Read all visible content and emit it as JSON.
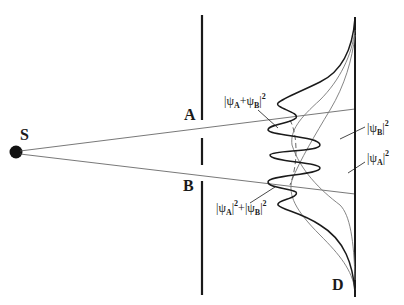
{
  "diagram": {
    "source_label": "S",
    "slit_a_label": "A",
    "slit_b_label": "B",
    "screen_label": "D",
    "curves": [
      {
        "id": "interference",
        "label_main": "|ψA+ψB|",
        "label_sup": "2",
        "parts": [
          "|ψ",
          "A",
          "+ψ",
          "B",
          "|",
          "2"
        ]
      },
      {
        "id": "sum",
        "parts": [
          "|ψ",
          "A",
          "|",
          "2",
          "+|ψ",
          "B",
          "|",
          "2"
        ]
      },
      {
        "id": "psi_b",
        "parts": [
          "|ψ",
          "B",
          "|",
          "2"
        ]
      },
      {
        "id": "psi_a",
        "parts": [
          "|ψ",
          "A",
          "|",
          "2"
        ]
      }
    ],
    "colors": {
      "ink": "#1a1a1a",
      "thin_line": "#555555",
      "background": "#ffffff"
    }
  }
}
